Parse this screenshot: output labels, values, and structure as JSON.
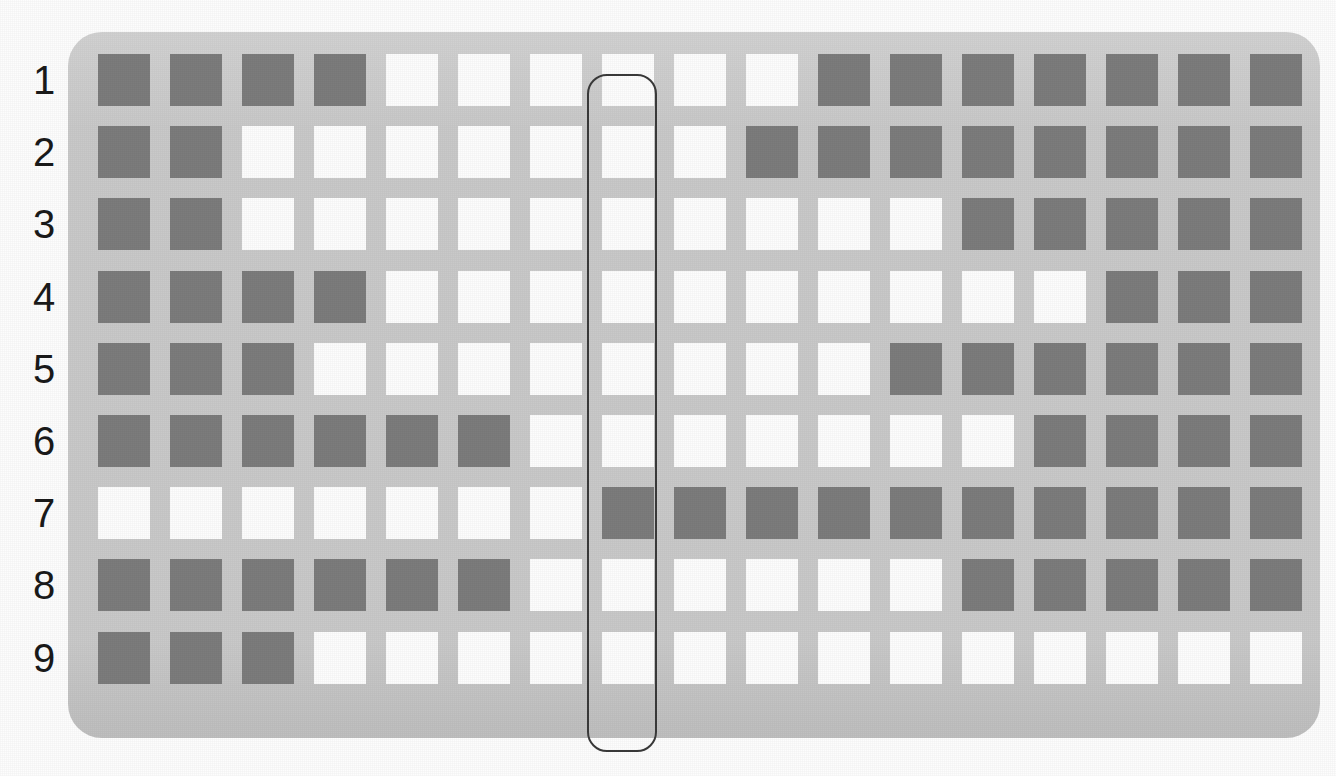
{
  "figure": {
    "type": "grid-matrix",
    "rows": 9,
    "columns": 17,
    "cell_states": [
      "dark",
      "light"
    ],
    "colors": {
      "plate": "#c9c9c9",
      "dark_cell": "#7c7c7c",
      "light_cell": "#fdfdfd",
      "highlight_outline": "#3a3a3a",
      "label_text": "#1a1a1a",
      "page_background": "#fdfdfd"
    }
  },
  "row_labels": [
    "1",
    "2",
    "3",
    "4",
    "5",
    "6",
    "7",
    "8",
    "9"
  ],
  "highlight": {
    "name": "column-highlight",
    "shape": "rounded-rectangle",
    "column_index": 7,
    "spans_rows": "1-9"
  },
  "chart_data": {
    "type": "heatmap",
    "title": "",
    "xlabel": "",
    "ylabel": "",
    "categories": [
      "1",
      "2",
      "3",
      "4",
      "5",
      "6",
      "7",
      "8",
      "9",
      "10",
      "11",
      "12",
      "13",
      "14",
      "15",
      "16",
      "17"
    ],
    "row_labels": [
      "1",
      "2",
      "3",
      "4",
      "5",
      "6",
      "7",
      "8",
      "9"
    ],
    "legend": [
      "dark",
      "light"
    ],
    "value_map": {
      "1": "dark",
      "0": "light"
    },
    "grid": [
      [
        1,
        1,
        1,
        1,
        0,
        0,
        0,
        0,
        0,
        0,
        1,
        1,
        1,
        1,
        1,
        1,
        1
      ],
      [
        1,
        1,
        0,
        0,
        0,
        0,
        0,
        0,
        0,
        1,
        1,
        1,
        1,
        1,
        1,
        1,
        1
      ],
      [
        1,
        1,
        0,
        0,
        0,
        0,
        0,
        0,
        0,
        0,
        0,
        0,
        1,
        1,
        1,
        1,
        1
      ],
      [
        1,
        1,
        1,
        1,
        0,
        0,
        0,
        0,
        0,
        0,
        0,
        0,
        0,
        0,
        1,
        1,
        1
      ],
      [
        1,
        1,
        1,
        0,
        0,
        0,
        0,
        0,
        0,
        0,
        0,
        1,
        1,
        1,
        1,
        1,
        1
      ],
      [
        1,
        1,
        1,
        1,
        1,
        1,
        0,
        0,
        0,
        0,
        0,
        0,
        0,
        1,
        1,
        1,
        1
      ],
      [
        0,
        0,
        0,
        0,
        0,
        0,
        0,
        1,
        1,
        1,
        1,
        1,
        1,
        1,
        1,
        1,
        1
      ],
      [
        1,
        1,
        1,
        1,
        1,
        1,
        0,
        0,
        0,
        0,
        0,
        0,
        1,
        1,
        1,
        1,
        1
      ],
      [
        1,
        1,
        1,
        0,
        0,
        0,
        0,
        0,
        0,
        0,
        0,
        0,
        0,
        0,
        0,
        0,
        0
      ]
    ],
    "dark_counts_per_row": [
      11,
      10,
      7,
      7,
      9,
      10,
      10,
      11,
      3
    ],
    "grid_on": false,
    "legend_position": "none"
  }
}
